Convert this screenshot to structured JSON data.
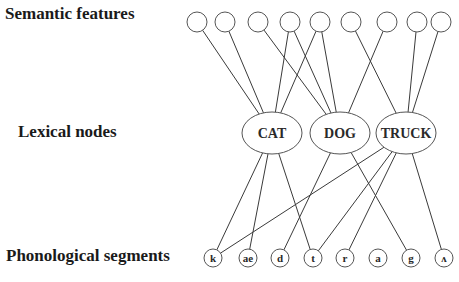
{
  "labels": {
    "semantic": "Semantic features",
    "lexical": "Lexical nodes",
    "phonological": "Phonological segments"
  },
  "semantic_features": [
    "s1",
    "s2",
    "s3",
    "s4",
    "s5",
    "s6",
    "s7",
    "s8",
    "s9"
  ],
  "lexical_nodes": [
    "CAT",
    "DOG",
    "TRUCK"
  ],
  "phonological_segments": [
    "k",
    "ae",
    "d",
    "t",
    "r",
    "a",
    "g",
    "ʌ"
  ],
  "semantic_to_lexical": [
    [
      "s1",
      "CAT"
    ],
    [
      "s2",
      "CAT"
    ],
    [
      "s4",
      "CAT"
    ],
    [
      "s5",
      "CAT"
    ],
    [
      "s3",
      "DOG"
    ],
    [
      "s4",
      "DOG"
    ],
    [
      "s5",
      "DOG"
    ],
    [
      "s7",
      "DOG"
    ],
    [
      "s6",
      "TRUCK"
    ],
    [
      "s8",
      "TRUCK"
    ],
    [
      "s9",
      "TRUCK"
    ]
  ],
  "lexical_to_phonological": [
    [
      "CAT",
      "k"
    ],
    [
      "CAT",
      "ae"
    ],
    [
      "CAT",
      "t"
    ],
    [
      "DOG",
      "d"
    ],
    [
      "DOG",
      "g"
    ],
    [
      "TRUCK",
      "k"
    ],
    [
      "TRUCK",
      "t"
    ],
    [
      "TRUCK",
      "r"
    ],
    [
      "TRUCK",
      "ʌ"
    ]
  ]
}
